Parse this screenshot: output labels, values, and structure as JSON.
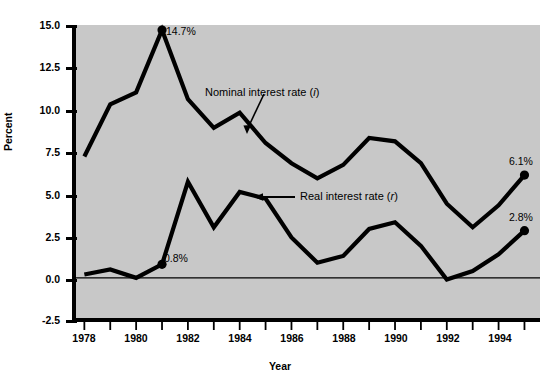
{
  "chart_data": {
    "type": "line",
    "title": "",
    "xlabel": "Year",
    "ylabel": "Percent",
    "x": [
      1978,
      1979,
      1980,
      1981,
      1982,
      1983,
      1984,
      1985,
      1986,
      1987,
      1988,
      1989,
      1990,
      1991,
      1992,
      1993,
      1994,
      1995
    ],
    "xlim": [
      1977.6,
      1995.6
    ],
    "ylim": [
      -2.5,
      15.0
    ],
    "yticks": [
      "15.0",
      "12.5",
      "10.0",
      "7.5",
      "5.0",
      "2.5",
      "0.0",
      "-2.5"
    ],
    "ytick_values": [
      15.0,
      12.5,
      10.0,
      7.5,
      5.0,
      2.5,
      0.0,
      -2.5
    ],
    "xticks": [
      "1978",
      "1980",
      "1982",
      "1984",
      "1986",
      "1988",
      "1990",
      "1992",
      "1994"
    ],
    "xtick_values": [
      1978,
      1980,
      1982,
      1984,
      1986,
      1988,
      1990,
      1992,
      1994
    ],
    "xtick_all_values": [
      1978,
      1979,
      1980,
      1981,
      1982,
      1983,
      1984,
      1985,
      1986,
      1987,
      1988,
      1989,
      1990,
      1991,
      1992,
      1993,
      1994,
      1995
    ],
    "grid": false,
    "legend_position": "inline-annotations",
    "plot_background": "#c8c8c8",
    "line_color": "#000000",
    "zero_line": 0.0,
    "series": [
      {
        "name": "Nominal interest rate (i)",
        "label_plain": "Nominal interest rate",
        "symbol": "i",
        "values": [
          7.2,
          10.3,
          11.0,
          14.7,
          10.6,
          8.9,
          9.8,
          8.0,
          6.8,
          5.9,
          6.7,
          8.3,
          8.1,
          6.8,
          4.4,
          3.0,
          4.3,
          6.1
        ],
        "markers": [
          {
            "x": 1981,
            "y": 14.7,
            "label": "14.7%"
          },
          {
            "x": 1995,
            "y": 6.1,
            "label": "6.1%"
          }
        ]
      },
      {
        "name": "Real interest rate (r)",
        "label_plain": "Real interest rate",
        "symbol": "r",
        "values": [
          0.2,
          0.5,
          0.0,
          0.8,
          5.7,
          3.0,
          5.1,
          4.7,
          2.4,
          0.9,
          1.3,
          2.9,
          3.3,
          1.9,
          -0.1,
          0.4,
          1.4,
          2.8
        ],
        "markers": [
          {
            "x": 1981,
            "y": 0.8,
            "label": "0.8%"
          },
          {
            "x": 1995,
            "y": 2.8,
            "label": "2.8%"
          }
        ]
      }
    ],
    "annotations": [
      {
        "name": "nominal-annotation",
        "text_plain": "Nominal interest rate",
        "symbol": "i",
        "text": "Nominal interest rate (i)",
        "arrow": "down-left"
      },
      {
        "name": "real-annotation",
        "text_plain": "Real interest rate",
        "symbol": "r",
        "text": "Real interest rate (r)",
        "arrow": "left"
      }
    ],
    "point_labels": [
      "14.7%",
      "0.8%",
      "6.1%",
      "2.8%"
    ]
  }
}
